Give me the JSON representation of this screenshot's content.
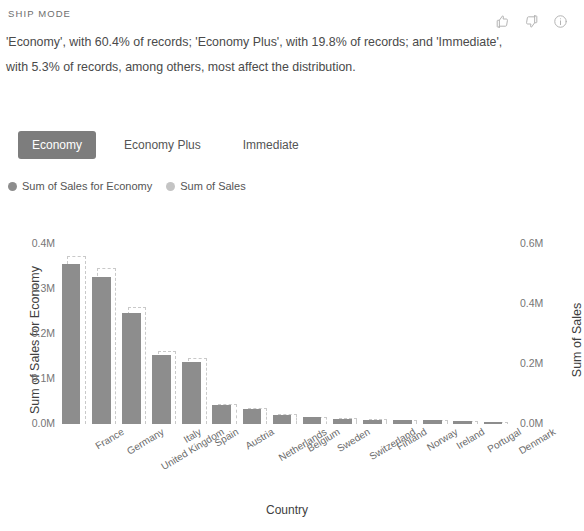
{
  "header": {
    "kicker": "SHIP MODE",
    "summary": "'Economy', with 60.4% of records; 'Economy Plus', with 19.8% of records; and 'Immediate', with 5.3% of records, among others, most affect the distribution.",
    "icons": [
      {
        "name": "thumbs-up-icon",
        "glyph": "thumbs-up"
      },
      {
        "name": "thumbs-down-icon",
        "glyph": "thumbs-down"
      },
      {
        "name": "info-icon",
        "glyph": "info"
      }
    ]
  },
  "tabs": [
    {
      "label": "Economy",
      "selected": true
    },
    {
      "label": "Economy Plus",
      "selected": false
    },
    {
      "label": "Immediate",
      "selected": false
    }
  ],
  "legend": [
    {
      "label": "Sum of Sales for Economy",
      "color": "#8d8d8d"
    },
    {
      "label": "Sum of Sales",
      "color": "#c4c4c4"
    }
  ],
  "colors": {
    "bar_primary": "#8d8d8d",
    "bar_secondary": "#c9c9c9",
    "tab_selected_bg": "#7d7d7d",
    "text": "#4a4a4a"
  },
  "chart_data": {
    "type": "bar",
    "title": "",
    "xlabel": "Country",
    "ylabel": "Sum of Sales for Economy",
    "y2label": "Sum of Sales",
    "ylim": [
      0,
      0.45
    ],
    "y2lim": [
      0,
      0.675
    ],
    "yticks": [
      "0.0M",
      "0.1M",
      "0.2M",
      "0.3M",
      "0.4M"
    ],
    "ytick_values": [
      0,
      0.1,
      0.2,
      0.3,
      0.4
    ],
    "y2ticks": [
      "0.0M",
      "0.2M",
      "0.4M",
      "0.6M"
    ],
    "y2tick_values": [
      0,
      0.2,
      0.4,
      0.6
    ],
    "grid": false,
    "legend_position": "above",
    "categories": [
      "France",
      "Germany",
      "United Kingdom",
      "Italy",
      "Spain",
      "Austria",
      "Netherlands",
      "Belgium",
      "Sweden",
      "Switzerland",
      "Finland",
      "Norway",
      "Ireland",
      "Portugal",
      "Denmark"
    ],
    "series": [
      {
        "name": "Sum of Sales for Economy",
        "axis": "left",
        "values": [
          0.355,
          0.325,
          0.245,
          0.152,
          0.138,
          0.042,
          0.033,
          0.021,
          0.015,
          0.012,
          0.01,
          0.009,
          0.008,
          0.006,
          0.004
        ]
      },
      {
        "name": "Sum of Sales",
        "axis": "right",
        "values": [
          0.56,
          0.52,
          0.39,
          0.243,
          0.22,
          0.067,
          0.053,
          0.034,
          0.024,
          0.019,
          0.016,
          0.014,
          0.013,
          0.01,
          0.007
        ]
      }
    ]
  }
}
